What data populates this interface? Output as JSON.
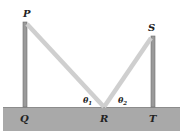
{
  "diagram": {
    "type": "physics-geometry",
    "labels": {
      "P": "P",
      "Q": "Q",
      "R": "R",
      "S": "S",
      "T": "T",
      "theta1": "θ",
      "theta1_sub": "1",
      "theta2": "θ",
      "theta2_sub": "2"
    },
    "colors": {
      "ground": "#a9a9a9",
      "ground_top": "#8c8c8c",
      "pole": "#9a9a9a",
      "pole_edge": "#6e6e6e",
      "wire": "#cfcfcf",
      "text": "#222222"
    }
  }
}
